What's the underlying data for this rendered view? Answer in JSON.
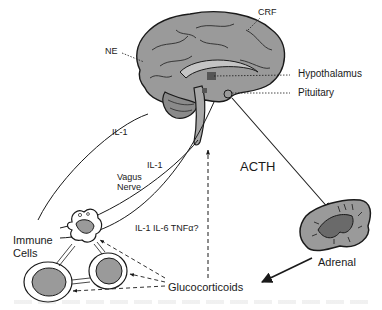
{
  "diagram": {
    "type": "neuroendocrine-immune feedback diagram",
    "colors": {
      "tissue_fill": "#9a9a9a",
      "tissue_dark": "#555555",
      "outline": "#1a1a1a",
      "background": "#ffffff"
    },
    "labels": {
      "crf": "CRF",
      "ne": "NE",
      "hypothalamus": "Hypothalamus",
      "pituitary": "Pituitary",
      "il1_upper": "IL-1",
      "il1_lower": "IL-1",
      "vagus_line1": "Vagus",
      "vagus_line2": "Nerve",
      "cytokines": "IL-1 IL-6 TNFα?",
      "acth": "ACTH",
      "adrenal": "Adrenal",
      "immune_line1": "Immune",
      "immune_line2": "Cells",
      "glucocorticoids": "Glucocorticoids"
    },
    "nodes": [
      "Brain (Hypothalamus/Pituitary)",
      "Adrenal",
      "Immune Cells",
      "Glucocorticoids"
    ],
    "edges": [
      {
        "from": "Immune Cells",
        "to": "Brain",
        "label": "IL-1",
        "style": "solid"
      },
      {
        "from": "Immune Cells",
        "to": "Brain",
        "label": "IL-1 (Vagus Nerve)",
        "style": "solid"
      },
      {
        "from": "Immune Cells",
        "to": "Brain",
        "label": "IL-1 IL-6 TNFα?",
        "style": "solid"
      },
      {
        "from": "Pituitary",
        "to": "Adrenal",
        "label": "ACTH",
        "style": "solid-arrow"
      },
      {
        "from": "Adrenal",
        "to": "Glucocorticoids",
        "label": "",
        "style": "solid-arrow"
      },
      {
        "from": "Glucocorticoids",
        "to": "Brain",
        "label": "",
        "style": "dashed-arrow"
      },
      {
        "from": "Glucocorticoids",
        "to": "Immune Cells",
        "label": "",
        "style": "dashed-arrow"
      }
    ]
  }
}
